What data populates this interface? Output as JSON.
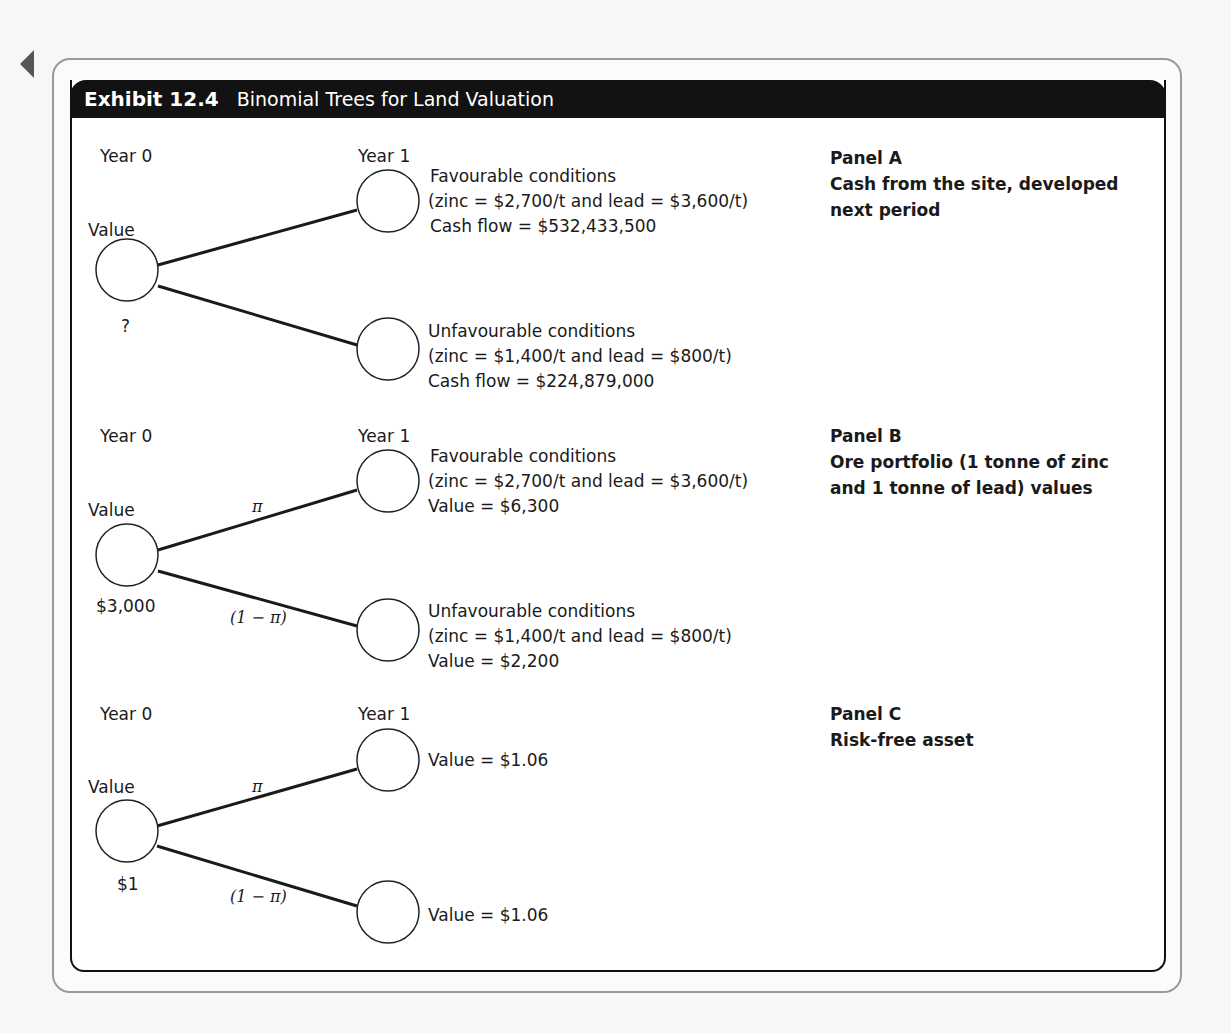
{
  "exhibit": {
    "number": "Exhibit 12.4",
    "title": "Binomial Trees for Land Valuation"
  },
  "panels": [
    {
      "id": "A",
      "label": "Panel A",
      "description_line1": "Cash from the site, developed",
      "description_line2": "next period",
      "year0_label": "Year 0",
      "year1_label": "Year 1",
      "root_label": "Value",
      "root_value": "?",
      "up_prob": "",
      "down_prob": "",
      "up": {
        "line1": "Favourable conditions",
        "line2": "(zinc = $2,700/t and lead = $3,600/t)",
        "line3": "Cash flow = $532,433,500"
      },
      "down": {
        "line1": "Unfavourable conditions",
        "line2": "(zinc = $1,400/t and lead = $800/t)",
        "line3": "Cash flow = $224,879,000"
      }
    },
    {
      "id": "B",
      "label": "Panel B",
      "description_line1": "Ore portfolio (1 tonne of zinc",
      "description_line2": "and 1 tonne of lead) values",
      "year0_label": "Year 0",
      "year1_label": "Year 1",
      "root_label": "Value",
      "root_value": "$3,000",
      "up_prob": "π",
      "down_prob": "(1 − π)",
      "up": {
        "line1": "Favourable conditions",
        "line2": "(zinc = $2,700/t and lead = $3,600/t)",
        "line3": "Value = $6,300"
      },
      "down": {
        "line1": "Unfavourable conditions",
        "line2": "(zinc = $1,400/t and lead = $800/t)",
        "line3": "Value = $2,200"
      }
    },
    {
      "id": "C",
      "label": "Panel C",
      "description_line1": "Risk-free asset",
      "description_line2": "",
      "year0_label": "Year 0",
      "year1_label": "Year 1",
      "root_label": "Value",
      "root_value": "$1",
      "up_prob": "π",
      "down_prob": "(1 − π)",
      "up": {
        "line1": "Value = $1.06",
        "line2": "",
        "line3": ""
      },
      "down": {
        "line1": "Value = $1.06",
        "line2": "",
        "line3": ""
      }
    }
  ]
}
